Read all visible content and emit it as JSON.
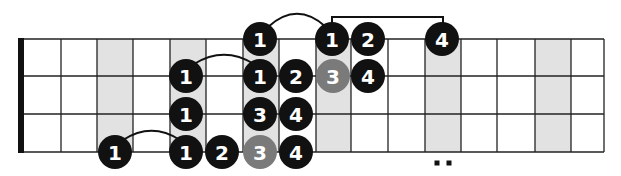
{
  "diagram": {
    "type": "guitar-scale-fretboard",
    "strings_shown": 4,
    "frets_shown": 16,
    "colors": {
      "background": "#ffffff",
      "line": "#222222",
      "nut": "#111111",
      "shaded_fret": "#e2e2e2",
      "dot_black": "#111111",
      "dot_gray": "#7a7a7a",
      "dot_text": "#ffffff",
      "connector": "#111111"
    },
    "geometry": {
      "nut_x": 18,
      "nut_width": 6,
      "fret_x": [
        24,
        61,
        97,
        133,
        170,
        206,
        243,
        279,
        316,
        351,
        388,
        425,
        461,
        497,
        535,
        571,
        604
      ],
      "string_y": [
        39,
        76,
        114,
        152
      ],
      "dot_radius": 17
    },
    "shaded_frets": [
      3,
      5,
      7,
      9,
      12,
      15
    ],
    "double_dot_marker": {
      "fret": 12,
      "x": [
        437,
        449
      ],
      "y": 163
    },
    "notes": [
      {
        "string": 0,
        "x": 260,
        "label": "1",
        "color": "black"
      },
      {
        "string": 0,
        "x": 332,
        "label": "1",
        "color": "black"
      },
      {
        "string": 0,
        "x": 368,
        "label": "2",
        "color": "black"
      },
      {
        "string": 0,
        "x": 442,
        "label": "4",
        "color": "black"
      },
      {
        "string": 1,
        "x": 186,
        "label": "1",
        "color": "black"
      },
      {
        "string": 1,
        "x": 260,
        "label": "1",
        "color": "black"
      },
      {
        "string": 1,
        "x": 296,
        "label": "2",
        "color": "black"
      },
      {
        "string": 1,
        "x": 333,
        "label": "3",
        "color": "gray"
      },
      {
        "string": 1,
        "x": 368,
        "label": "4",
        "color": "black"
      },
      {
        "string": 2,
        "x": 186,
        "label": "1",
        "color": "black"
      },
      {
        "string": 2,
        "x": 260,
        "label": "3",
        "color": "black"
      },
      {
        "string": 2,
        "x": 296,
        "label": "4",
        "color": "black"
      },
      {
        "string": 3,
        "x": 115,
        "label": "1",
        "color": "black"
      },
      {
        "string": 3,
        "x": 186,
        "label": "1",
        "color": "black"
      },
      {
        "string": 3,
        "x": 222,
        "label": "2",
        "color": "black"
      },
      {
        "string": 3,
        "x": 260,
        "label": "3",
        "color": "gray"
      },
      {
        "string": 3,
        "x": 296,
        "label": "4",
        "color": "black"
      }
    ],
    "arcs": [
      {
        "from_x": 115,
        "to_x": 186,
        "string": 3,
        "peak_y": 128
      },
      {
        "from_x": 186,
        "to_x": 260,
        "string": 1,
        "peak_y": 52
      },
      {
        "from_x": 260,
        "to_x": 332,
        "string": 0,
        "peak_y": 10
      }
    ],
    "brackets": [
      {
        "from_x": 332,
        "to_x": 443,
        "top_y": 17,
        "string": 0
      }
    ]
  }
}
